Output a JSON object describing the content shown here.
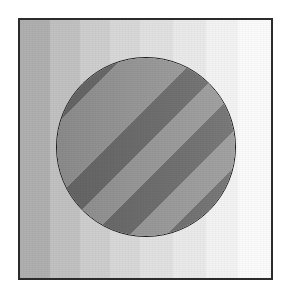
{
  "figure": {
    "canvas": {
      "width": 290,
      "height": 297,
      "background_color": "#ffffff"
    },
    "frame": {
      "label": "image-border",
      "left": 18,
      "top": 18,
      "width": 255,
      "height": 262,
      "border_color": "#2b2b2b",
      "border_width": 2,
      "margin_color": "#ffffff"
    },
    "background": {
      "label": "vertical-gradient-stripes",
      "orientation": "vertical",
      "direction": "dark-left-to-light-right",
      "stripe_count": 8,
      "stripes": [
        {
          "name": "stripe-1",
          "color": "#b0b0b0",
          "width_pct": 12
        },
        {
          "name": "stripe-2",
          "color": "#c2c2c2",
          "width_pct": 12
        },
        {
          "name": "stripe-3",
          "color": "#cfcfcf",
          "width_pct": 12
        },
        {
          "name": "stripe-4",
          "color": "#d9d9d9",
          "width_pct": 12
        },
        {
          "name": "stripe-5",
          "color": "#e2e2e2",
          "width_pct": 13
        },
        {
          "name": "stripe-6",
          "color": "#ebebeb",
          "width_pct": 13
        },
        {
          "name": "stripe-7",
          "color": "#f4f4f4",
          "width_pct": 13
        },
        {
          "name": "stripe-8",
          "color": "#fcfcfc",
          "width_pct": 13
        }
      ]
    },
    "circle": {
      "label": "striped-circle",
      "center_x": 146,
      "center_y": 147,
      "radius": 90,
      "diameter": 180,
      "outline_color": "#1c1c1c",
      "outline_width": 1.5,
      "fill": {
        "pattern": "diagonal-stripes",
        "angle_deg": 45,
        "direction": "lower-left-to-upper-right",
        "band_width_px": 26,
        "dark_color": "#6e6e6e",
        "light_color": "#9a9a9a",
        "band_count": 7,
        "bands": [
          {
            "name": "band-1",
            "color": "#9a9a9a"
          },
          {
            "name": "band-2",
            "color": "#6e6e6e"
          },
          {
            "name": "band-3",
            "color": "#9a9a9a"
          },
          {
            "name": "band-4",
            "color": "#6e6e6e"
          },
          {
            "name": "band-5",
            "color": "#9a9a9a"
          },
          {
            "name": "band-6",
            "color": "#6e6e6e"
          },
          {
            "name": "band-7",
            "color": "#9a9a9a"
          }
        ]
      }
    }
  }
}
